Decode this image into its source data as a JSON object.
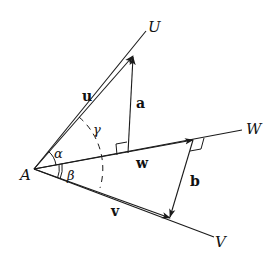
{
  "diagram": {
    "title": "",
    "points": {
      "A": {
        "label": "A",
        "x": 34,
        "y": 169
      },
      "U": {
        "label": "U",
        "x": 152,
        "y": 27
      },
      "W": {
        "label": "W",
        "x": 252,
        "y": 130
      },
      "V": {
        "label": "V",
        "x": 220,
        "y": 244
      }
    },
    "vectors": {
      "u": {
        "label": "u"
      },
      "v": {
        "label": "v"
      },
      "w": {
        "label": "w"
      },
      "a": {
        "label": "a"
      },
      "b": {
        "label": "b"
      }
    },
    "angles": {
      "alpha": {
        "label": "α"
      },
      "beta": {
        "label": "β"
      },
      "gamma": {
        "label": "γ"
      }
    },
    "colors": {
      "stroke": "#1a1a1a",
      "background": "#ffffff"
    }
  }
}
